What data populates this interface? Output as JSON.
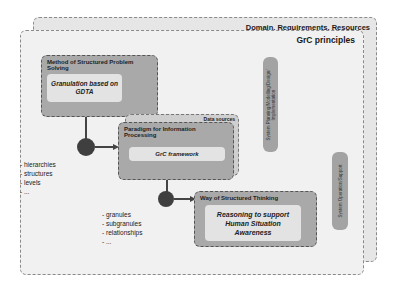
{
  "layers": {
    "outer_label": "Domain, Requirements, Resources",
    "inner_label": "GrC principles"
  },
  "boxes": [
    {
      "title": "Method of Structured Problem Solving",
      "content": "Granulation based on GDTA"
    },
    {
      "title": "Paradigm for Information Processing",
      "content": "GrC framework",
      "tag": "Data sources"
    },
    {
      "title": "Way of Structured Thinking",
      "content": "Reasoning to support Human Situation Awareness"
    }
  ],
  "vertical_bars": [
    {
      "label": "System Planning/Modelling/Design/ Implementation"
    },
    {
      "label": "System Operation/Support"
    }
  ],
  "lists": {
    "first": [
      "- hierarchies",
      "- structures",
      "- levels",
      "- ..."
    ],
    "second": [
      "- granules",
      "- subgranules",
      "- relationships",
      "- ..."
    ]
  }
}
